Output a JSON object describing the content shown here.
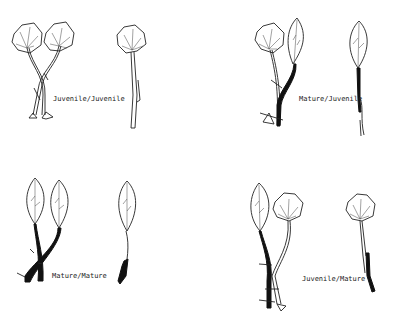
{
  "figure": {
    "panels": [
      {
        "id": "top-left",
        "label": "Juvenile/Juvenile",
        "scion": "Juvenile",
        "stock": "Juvenile"
      },
      {
        "id": "top-right",
        "label": "Mature/Juvenile",
        "scion": "Mature",
        "stock": "Juvenile"
      },
      {
        "id": "bottom-left",
        "label": "Mature/Mature",
        "scion": "Mature",
        "stock": "Mature"
      },
      {
        "id": "bottom-right",
        "label": "Juvenile/Mature",
        "scion": "Juvenile",
        "stock": "Mature"
      }
    ],
    "colors": {
      "ink": "#222222",
      "background": "#ffffff"
    }
  }
}
